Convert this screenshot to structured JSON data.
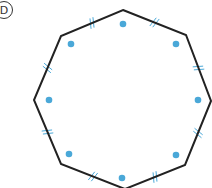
{
  "figure": {
    "label": "D",
    "shape": "regular-octagon",
    "colors": {
      "outline": "#222222",
      "dot": "#4aa8d8",
      "tick": "#4aa8d8"
    },
    "vertices": [
      [
        123,
        10
      ],
      [
        186,
        35
      ],
      [
        211,
        101
      ],
      [
        185,
        165
      ],
      [
        125,
        189
      ],
      [
        61,
        164
      ],
      [
        34,
        100
      ],
      [
        61,
        36
      ]
    ],
    "dots": [
      [
        123,
        24
      ],
      [
        71,
        44
      ],
      [
        176,
        44
      ],
      [
        49,
        100
      ],
      [
        198,
        100
      ],
      [
        69,
        154
      ],
      [
        176,
        155
      ],
      [
        122,
        178
      ]
    ],
    "tick_marks": [
      [
        93,
        23
      ],
      [
        154,
        23
      ],
      [
        46,
        67
      ],
      [
        198,
        69
      ],
      [
        46,
        133
      ],
      [
        197,
        133
      ],
      [
        92,
        176
      ],
      [
        155,
        176
      ]
    ]
  }
}
